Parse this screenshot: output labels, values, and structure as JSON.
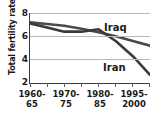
{
  "chart_data": {
    "type": "line",
    "title": "",
    "xlabel": "",
    "ylabel": "Total fertility rate",
    "ylim": [
      2,
      8
    ],
    "yticks": [
      8,
      6,
      4,
      2
    ],
    "grid": "horizontal",
    "legend_position": "inline-right",
    "categories": [
      "1960-65",
      "1965-70",
      "1970-75",
      "1975-80",
      "1980-85",
      "1985-90",
      "1990-95",
      "1995-2000"
    ],
    "x_tick_labels_shown": [
      "1960-65",
      "1970-75",
      "1980-85",
      "1995-2000"
    ],
    "series": [
      {
        "name": "Iraq",
        "color": "#4a4a4a",
        "values": [
          7.2,
          7.05,
          6.9,
          6.65,
          6.35,
          6.0,
          5.6,
          5.2
        ]
      },
      {
        "name": "Iran",
        "color": "#3a3a3a",
        "values": [
          7.1,
          6.75,
          6.4,
          6.4,
          6.6,
          5.6,
          4.3,
          2.7
        ]
      }
    ]
  },
  "axis": {
    "y_title": "Total fertility rate",
    "y_tick_8": "8",
    "y_tick_6": "6",
    "y_tick_4": "4",
    "y_tick_2": "2",
    "x_label_1": "1960-\n65",
    "x_label_2": "1970-\n75",
    "x_label_3": "1980-\n85",
    "x_label_4": "1995-\n2000"
  },
  "labels": {
    "iraq": "Iraq",
    "iran": "Iran"
  },
  "colors": {
    "line": "#3f3f3f",
    "grid": "#b9b9b9",
    "axis": "#3a3a3a",
    "text": "#1a1a1a",
    "background": "#ffffff"
  }
}
